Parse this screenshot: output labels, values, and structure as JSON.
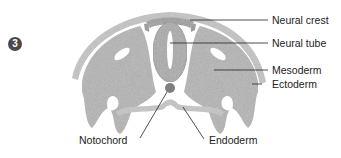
{
  "figure": {
    "step_number": "3",
    "colors": {
      "tissue": "#b9b9b9",
      "tissue_dark": "#9a9a9a",
      "outline": "#d0d0d0",
      "leader": "#222222",
      "badge": "#4a4a4a"
    },
    "labels": {
      "neural_crest": "Neural crest",
      "neural_tube": "Neural tube",
      "mesoderm": "Mesoderm",
      "ectoderm": "Ectoderm",
      "notochord": "Notochord",
      "endoderm": "Endoderm"
    }
  }
}
